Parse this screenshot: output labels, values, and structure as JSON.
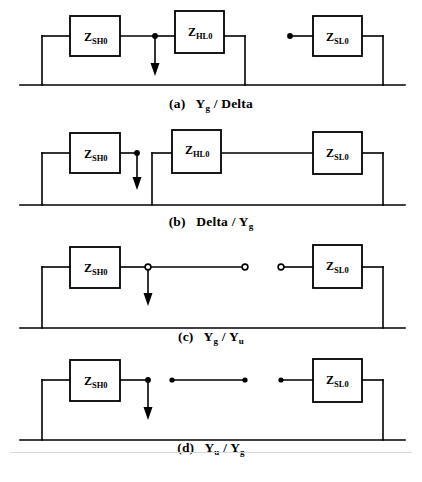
{
  "figure": {
    "type": "circuit-diagram",
    "background_color": "#ffffff",
    "line_color": "#000000",
    "panel_count": 4
  },
  "blocks": {
    "sh0": {
      "symbol": "Z",
      "subscript": "SH0",
      "full": "Z_SH0"
    },
    "hl0": {
      "symbol": "Z",
      "subscript": "HL0",
      "full": "Z_HL0"
    },
    "sl0": {
      "symbol": "Z",
      "subscript": "SL0",
      "full": "Z_SL0"
    }
  },
  "panels": [
    {
      "id": "a",
      "tag": "(a)",
      "left_term": "Y",
      "left_sub": "g",
      "divider": "/",
      "right_term": "Delta",
      "right_sub": "",
      "caption_plain": "(a)  Yg  / Delta",
      "blocks": [
        "Z_SH0",
        "Z_HL0",
        "Z_SL0"
      ],
      "node_marker": "filled-dot",
      "source_marker": "filled-dot",
      "has_arrow": true,
      "arrow_direction": "down"
    },
    {
      "id": "b",
      "tag": "(b)",
      "left_term": "Delta",
      "left_sub": "",
      "divider": "/",
      "right_term": "Y",
      "right_sub": "g",
      "caption_plain": "(b)  Delta / Yg",
      "blocks": [
        "Z_SH0",
        "Z_HL0",
        "Z_SL0"
      ],
      "node_marker": "filled-dot",
      "source_marker": "none",
      "has_arrow": true,
      "arrow_direction": "down"
    },
    {
      "id": "c",
      "tag": "(c)",
      "left_term": "Y",
      "left_sub": "g",
      "divider": "/",
      "right_term": "Y",
      "right_sub": "u",
      "caption_plain": "(c)  Yg  / Yu",
      "blocks": [
        "Z_SH0",
        "Z_SL0"
      ],
      "node_marker": "open-circle",
      "source_marker": "open-circle",
      "has_arrow": true,
      "arrow_direction": "down"
    },
    {
      "id": "d",
      "tag": "(d)",
      "left_term": "Y",
      "left_sub": "u",
      "divider": "/",
      "right_term": "Y",
      "right_sub": "g",
      "caption_plain": "(d)  Yu  / Yg",
      "blocks": [
        "Z_SH0",
        "Z_SL0"
      ],
      "node_marker": "filled-dot",
      "source_marker": "filled-dot",
      "has_arrow": true,
      "arrow_direction": "down"
    }
  ]
}
